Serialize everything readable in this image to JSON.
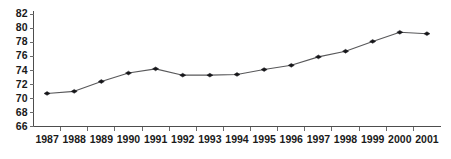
{
  "chart_data": {
    "type": "line",
    "title": "",
    "subtitle": "",
    "xlabel": "",
    "ylabel": "",
    "categories": [
      "1987",
      "1988",
      "1989",
      "1990",
      "1991",
      "1992",
      "1993",
      "1994",
      "1995",
      "1996",
      "1997",
      "1998",
      "1999",
      "2000",
      "2001"
    ],
    "x": [
      1987,
      1988,
      1989,
      1990,
      1991,
      1992,
      1993,
      1994,
      1995,
      1996,
      1997,
      1998,
      1999,
      2000,
      2001
    ],
    "values": [
      70.7,
      71.0,
      72.4,
      73.6,
      74.2,
      73.3,
      73.3,
      73.4,
      74.1,
      74.7,
      75.9,
      76.7,
      78.1,
      79.4,
      79.2
    ],
    "series": [
      {
        "name": "",
        "values": [
          70.7,
          71.0,
          72.4,
          73.6,
          74.2,
          73.3,
          73.3,
          73.4,
          74.1,
          74.7,
          75.9,
          76.7,
          78.1,
          79.4,
          79.2
        ]
      }
    ],
    "ylim": [
      66,
      82
    ],
    "yticks": [
      66,
      68,
      70,
      72,
      74,
      76,
      78,
      80,
      82
    ],
    "ytick_labels": [
      "66",
      "68",
      "70",
      "72",
      "74",
      "76",
      "78",
      "80",
      "82"
    ],
    "xtick_labels": [
      "1987",
      "1988",
      "1989",
      "1990",
      "1991",
      "1992",
      "1993",
      "1994",
      "1995",
      "1996",
      "1997",
      "1998",
      "1999",
      "2000",
      "2001"
    ],
    "grid": false,
    "legend": false,
    "legend_position": "none",
    "marker": "diamond",
    "line_color": "#58585a",
    "marker_color": "#17171a",
    "axis_color": "#4d4d4d",
    "background_color": "#ffffff",
    "annotations": []
  }
}
